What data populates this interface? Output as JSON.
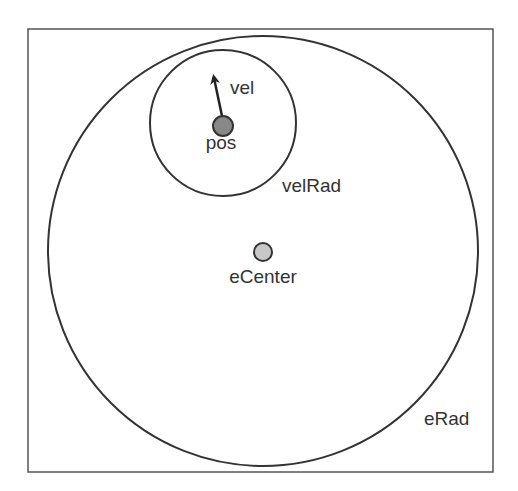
{
  "diagram": {
    "frame": {
      "x": 28,
      "y": 29,
      "width": 465,
      "height": 443,
      "stroke": "#555555"
    },
    "outer_circle": {
      "cx": 263,
      "cy": 251,
      "r": 215,
      "label": "eRad",
      "stroke": "#333333"
    },
    "inner_circle": {
      "cx": 223,
      "cy": 123,
      "r": 73,
      "label": "velRad",
      "stroke": "#333333"
    },
    "pos_point": {
      "cx": 223,
      "cy": 126,
      "r": 10,
      "label": "pos",
      "fill": "#888888"
    },
    "center_point": {
      "cx": 263,
      "cy": 252,
      "r": 9,
      "label": "eCenter",
      "fill": "#c8c8c8"
    },
    "velocity_arrow": {
      "x1": 222,
      "y1": 116,
      "x2": 213,
      "y2": 72,
      "label": "vel",
      "stroke": "#222222"
    }
  },
  "labels": {
    "vel": "vel",
    "pos": "pos",
    "velRad": "velRad",
    "eCenter": "eCenter",
    "eRad": "eRad"
  }
}
